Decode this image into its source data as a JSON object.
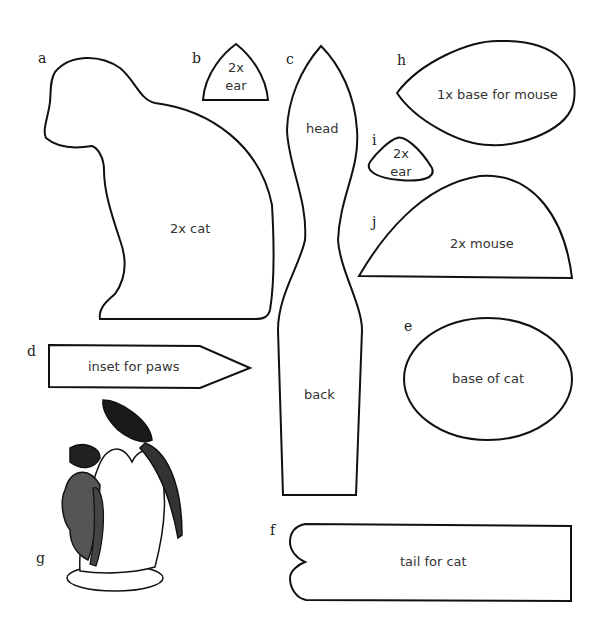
{
  "pieces": [
    {
      "letter": "a",
      "label": "2x cat"
    },
    {
      "letter": "b",
      "label_line1": "2x",
      "label_line2": "ear"
    },
    {
      "letter": "c",
      "label_top": "head",
      "label_bottom": "back"
    },
    {
      "letter": "d",
      "label": "inset for paws"
    },
    {
      "letter": "e",
      "label": "base of cat"
    },
    {
      "letter": "f",
      "label": "tail for cat"
    },
    {
      "letter": "g"
    },
    {
      "letter": "h",
      "label": "1x base for mouse"
    },
    {
      "letter": "i",
      "label_line1": "2x",
      "label_line2": "ear"
    },
    {
      "letter": "j",
      "label": "2x mouse"
    }
  ],
  "colors": {
    "stroke": "#111111",
    "background": "#ffffff"
  }
}
